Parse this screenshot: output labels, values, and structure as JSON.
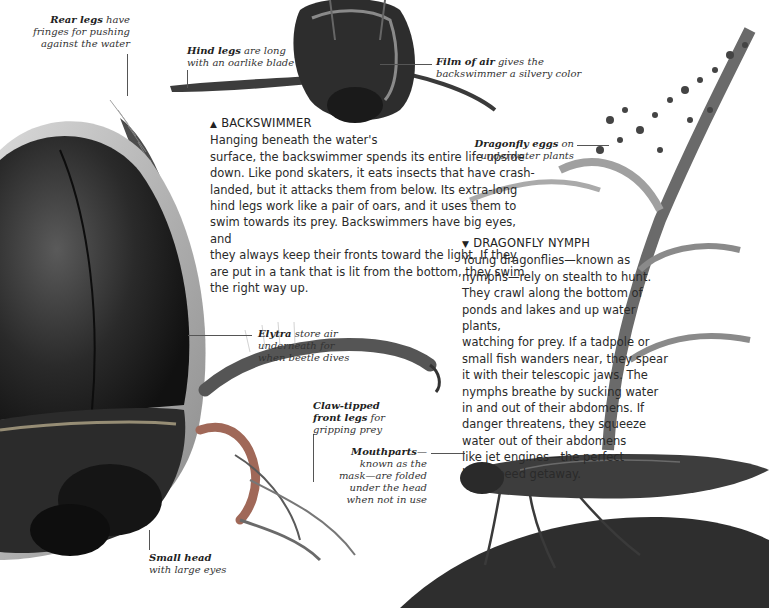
{
  "page": {
    "type": "encyclopedia-spread",
    "topic": "Water insects"
  },
  "sections": {
    "backswimmer": {
      "marker": "▲",
      "heading": "BACKSWIMMER",
      "body": "Hanging beneath the water's surface, the backswimmer spends its entire life upside down. Like pond skaters, it eats insects that have crash-landed, but it attacks them from below. Its extra-long hind legs work like a pair of oars, and it uses them to swim towards its prey. Backswimmers have big eyes, and they always keep their fronts toward the light. If they are put in a tank that is lit from the bottom, they swim the right way up.",
      "body_lines": [
        "Hanging beneath the water's",
        "surface, the backswimmer spends its entire life upside",
        "down. Like pond skaters, it eats insects that have crash-",
        "landed, but it attacks them from below. Its extra-long",
        "hind legs work like a pair of oars, and it uses them to",
        "swim towards its prey. Backswimmers have big eyes, and",
        "they always keep their fronts toward the light. If they",
        "are put in a tank that is lit from the bottom, they swim",
        "the right way up."
      ]
    },
    "dragonfly_nymph": {
      "marker": "▼",
      "heading": "DRAGONFLY NYMPH",
      "body": "Young dragonflies—known as nymphs—rely on stealth to hunt. They crawl along the bottom of ponds and lakes and up water plants, watching for prey. If a tadpole or small fish wanders near, they spear it with their telescopic jaws. The nymphs breathe by sucking water in and out of their abdomens. If danger threatens, they squeeze water out of their abdomens like jet engines—the perfect high-speed getaway.",
      "body_lines": [
        "Young dragonflies—known as",
        "nymphs—rely on stealth to hunt.",
        "They crawl along the bottom of",
        "ponds and lakes and up water plants,",
        "watching for prey. If a tadpole or",
        "small fish wanders near, they spear",
        "it with their telescopic jaws. The",
        "nymphs breathe by sucking water",
        "in and out of their abdomens. If",
        "danger threatens, they squeeze",
        "water out of their abdomens",
        "like jet engines—the perfect",
        "high-speed getaway."
      ]
    }
  },
  "labels": {
    "rear_legs": {
      "bold": "Rear legs",
      "rest_1": " have",
      "line2": "fringes for pushing",
      "line3": "against the water"
    },
    "hind_legs": {
      "bold": "Hind legs",
      "rest_1": " are long",
      "line2": "with an oarlike blade"
    },
    "film_of_air": {
      "bold": "Film of air",
      "rest_1": " gives the",
      "line2": "backswimmer a silvery color"
    },
    "dragonfly_eggs": {
      "bold": "Dragonfly eggs",
      "rest_1": " on",
      "line2": "underwater plants"
    },
    "elytra": {
      "bold": "Elytra",
      "rest_1": " store air",
      "line2": "underneath for",
      "line3": "when beetle dives"
    },
    "claw_tipped": {
      "bold": "Claw-tipped",
      "line2_bold": "front legs",
      "line2_rest": " for",
      "line3": "gripping prey"
    },
    "mouthparts": {
      "bold": "Mouthparts",
      "rest_1": "—",
      "line2": "known as the",
      "line3": "mask—are folded",
      "line4": "under the head",
      "line5": "when not in use"
    },
    "small_head": {
      "bold": "Small head",
      "line2": "with large eyes"
    }
  },
  "colors": {
    "background": "#ffffff",
    "beetle_dark": "#1e1e1e",
    "beetle_mid": "#4a4a4a",
    "beetle_edge": "#b9b9b9",
    "plant": "#6a6a6a",
    "nymph": "#3d3d3d",
    "mud": "#2e2e2e",
    "text": "#2a2a2a"
  }
}
